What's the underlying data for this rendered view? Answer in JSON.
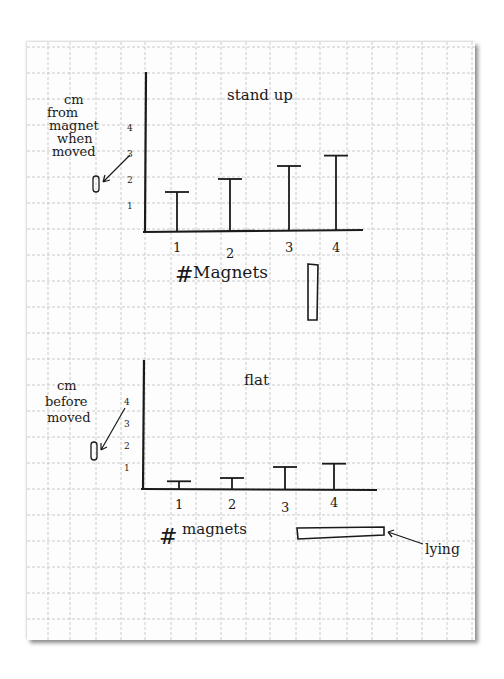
{
  "chart_data": [
    {
      "type": "bar",
      "style": "hand-drawn T-shaped bars on graph paper",
      "title": "stand up",
      "xlabel": "# Magnets",
      "ylabel": "cm from magnet when moved",
      "categories": [
        "1",
        "2",
        "3",
        "4"
      ],
      "values": [
        1.5,
        2.0,
        2.5,
        2.9
      ],
      "yticks": [
        "1",
        "2",
        "3",
        "4"
      ],
      "ylim": [
        0,
        4.5
      ],
      "grid": true,
      "annotation": "vertical magnet sketch (standing)"
    },
    {
      "type": "bar",
      "style": "hand-drawn T-shaped bars on graph paper",
      "title": "flat",
      "xlabel": "# magnets",
      "ylabel": "cm before moved",
      "categories": [
        "1",
        "2",
        "3",
        "4"
      ],
      "values": [
        0.35,
        0.5,
        1.0,
        1.15
      ],
      "yticks": [
        "1",
        "2",
        "3",
        "4"
      ],
      "ylim": [
        0,
        4.5
      ],
      "grid": true,
      "annotation": "lying"
    }
  ],
  "charts": {
    "top": {
      "title": "stand up",
      "xlabel_hash": "#",
      "xlabel_word": "Magnets",
      "ylabel_lines": [
        "cm",
        "from",
        "magnet",
        "when",
        "moved"
      ],
      "xticks": [
        "1",
        "2",
        "3",
        "4"
      ],
      "yticks": [
        "1",
        "2",
        "3",
        "4"
      ]
    },
    "bottom": {
      "title": "flat",
      "xlabel_hash": "#",
      "xlabel_word": "magnets",
      "ylabel_lines": [
        "cm",
        "before",
        "moved"
      ],
      "xticks": [
        "1",
        "2",
        "3",
        "4"
      ],
      "yticks": [
        "1",
        "2",
        "3",
        "4"
      ],
      "annotation": "lying"
    }
  },
  "colors": {
    "ink": "#1a1a1a",
    "grid": "#bcbcbc",
    "paper": "#fdfdfd"
  }
}
